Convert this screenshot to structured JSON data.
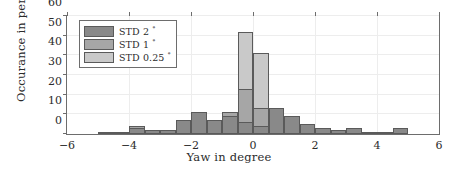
{
  "chart_data": {
    "type": "bar",
    "title": "",
    "xlabel": "Yaw in degree",
    "ylabel": "Occurance in percent",
    "xlim": [
      -6,
      6
    ],
    "ylim": [
      0,
      60
    ],
    "xticks": [
      "-6",
      "-4",
      "-2",
      "0",
      "2",
      "4",
      "6"
    ],
    "xtick_values": [
      -6,
      -4,
      -2,
      0,
      2,
      4,
      6
    ],
    "yticks": [
      "0",
      "10",
      "20",
      "30",
      "40",
      "50",
      "60"
    ],
    "ytick_values": [
      0,
      10,
      20,
      30,
      40,
      50,
      60
    ],
    "grid": true,
    "legend_position": "top-left",
    "bin_width": 0.5,
    "bin_starts": [
      -6.0,
      -5.5,
      -5.0,
      -4.5,
      -4.0,
      -3.5,
      -3.0,
      -2.5,
      -2.0,
      -1.5,
      -1.0,
      -0.5,
      0.0,
      0.5,
      1.0,
      1.5,
      2.0,
      2.5,
      3.0,
      3.5,
      4.0,
      4.5,
      5.0,
      5.5
    ],
    "series": [
      {
        "name": "STD 0.25",
        "label": "STD 0.25 °",
        "color": "#c9c9c9",
        "values": [
          0,
          0,
          0,
          0,
          0,
          0,
          0,
          0,
          0,
          0,
          10,
          52,
          41,
          8,
          0,
          0,
          0,
          0,
          0,
          0,
          0,
          0,
          0,
          0
        ]
      },
      {
        "name": "STD 1",
        "label": "STD 1 °",
        "color": "#a6a6a6",
        "values": [
          0,
          0,
          1,
          0,
          4,
          1,
          2,
          5,
          9,
          6,
          11,
          23,
          13,
          13,
          6,
          3,
          1,
          0,
          2,
          1,
          0,
          3,
          0,
          0
        ]
      },
      {
        "name": "STD 2",
        "label": "STD 2 °",
        "color": "#898989",
        "values": [
          0,
          0,
          1,
          1,
          3,
          2,
          2,
          7,
          11,
          7,
          9,
          6,
          4,
          13,
          9,
          5,
          3,
          2,
          3,
          1,
          1,
          3,
          0,
          0
        ]
      }
    ]
  },
  "legend": {
    "entries": [
      {
        "label": "STD 2",
        "unit": "°",
        "color": "#898989"
      },
      {
        "label": "STD 1",
        "unit": "°",
        "color": "#a6a6a6"
      },
      {
        "label": "STD 0.25",
        "unit": "°",
        "color": "#c9c9c9"
      }
    ]
  }
}
